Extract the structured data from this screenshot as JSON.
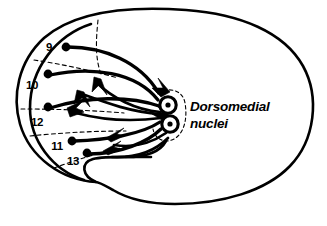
{
  "figure": {
    "kind": "neuroanatomy-schematic",
    "background_color": "#ffffff",
    "ink_color": "#000000"
  },
  "labels": {
    "nuclei": {
      "line1": "Dorsomedial",
      "line2": "nuclei"
    }
  },
  "cortical_areas": [
    {
      "id": "area-9",
      "number": "9",
      "label_x": 49,
      "label_y": 51,
      "dot_x": 66,
      "dot_y": 47
    },
    {
      "id": "area-10",
      "number": "10",
      "label_x": 32,
      "label_y": 89,
      "dot_x": 48,
      "dot_y": 74
    },
    {
      "id": "area-12",
      "number": "12",
      "label_x": 37,
      "label_y": 126,
      "dot_x": 48,
      "dot_y": 107
    },
    {
      "id": "area-11",
      "number": "11",
      "label_x": 57,
      "label_y": 150,
      "dot_x": 72,
      "dot_y": 141
    },
    {
      "id": "area-13",
      "number": "13",
      "label_x": 73,
      "label_y": 165,
      "dot_x": 87,
      "dot_y": 153
    }
  ],
  "nuclei_markers": [
    {
      "id": "dorsomedial-nucleus-upper",
      "cx": 168,
      "cy": 105,
      "outer_r": 8.2,
      "core_r": 2.6
    },
    {
      "id": "dorsomedial-nucleus-lower",
      "cx": 170,
      "cy": 124,
      "outer_r": 8.2,
      "core_r": 2.6
    }
  ],
  "counts": {
    "cortical_areas": 5,
    "nuclei": 2
  }
}
